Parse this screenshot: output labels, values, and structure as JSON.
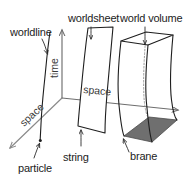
{
  "figure": {
    "background_color": "#ffffff",
    "width": 188,
    "height": 182
  },
  "axes": {
    "time": {
      "label": "time",
      "orientation": "vertical-up",
      "color": "#6e6e6e"
    },
    "space_horizontal": {
      "label": "space",
      "orientation": "horizontal-right",
      "color": "#6e6e6e"
    },
    "space_depth": {
      "label": "space",
      "orientation": "diagonal-down-left",
      "color": "#8a8a8a"
    }
  },
  "objects": [
    {
      "id": "worldline",
      "label": "worldline",
      "object_label": "particle",
      "dimension": "1D curve",
      "color": "#1e1e1e"
    },
    {
      "id": "worldsheet",
      "label": "worldsheet",
      "object_label": "string",
      "dimension": "2D ribbon",
      "color": "#1e1e1e"
    },
    {
      "id": "world-volume",
      "label": "world volume",
      "object_label": "brane",
      "dimension": "3D tube",
      "color": "#1e1e1e",
      "brane_fill": "#6f6f6f"
    }
  ],
  "labels": {
    "worldline": "worldline",
    "worldsheet": "worldsheet",
    "world_volume": "world volume",
    "particle": "particle",
    "string": "string",
    "brane": "brane",
    "time": "time",
    "space_top": "space",
    "space_diag": "space"
  }
}
